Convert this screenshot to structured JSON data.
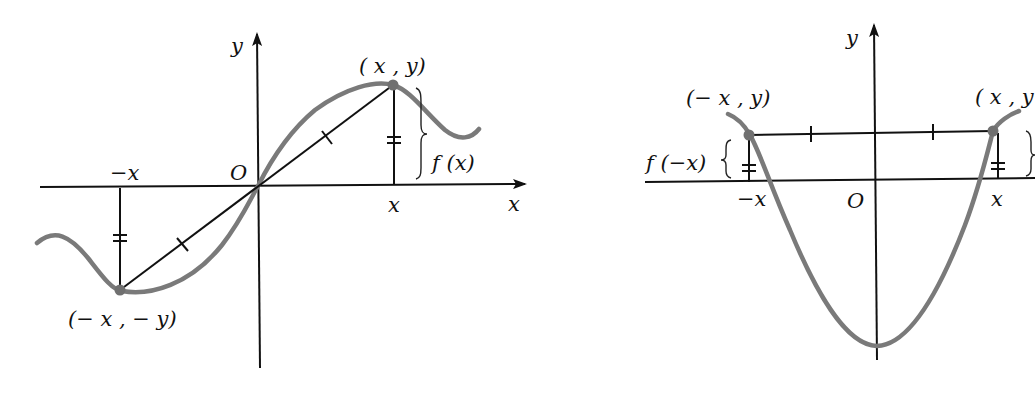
{
  "figures": [
    {
      "id": "odd-function",
      "labels": {
        "y_axis": "y",
        "x_axis": "x",
        "origin": "O",
        "point_pos": "( x , y)",
        "point_neg": "(− x , − y)",
        "func_value": "f (x)",
        "x_tick_pos": "x",
        "x_tick_neg": "−x"
      }
    },
    {
      "id": "even-function",
      "labels": {
        "y_axis": "y",
        "origin": "O",
        "point_pos": "( x , y",
        "point_neg": "(− x , y)",
        "func_value": "f (−x)",
        "x_tick_pos": "x",
        "x_tick_neg": "−x"
      }
    }
  ],
  "colors": {
    "curve": "#7a7a7a",
    "axis": "#111111",
    "point": "#707070"
  }
}
